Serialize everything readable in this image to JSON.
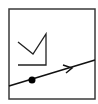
{
  "diagram": {
    "frame": {
      "x": 9,
      "y": 9,
      "width": 86,
      "height": 90,
      "stroke": "#3a3a3a"
    },
    "crown": {
      "points": "18,42 33,54 46,34 46,65 18,65",
      "stroke": "#222222"
    },
    "line": {
      "x1": 9,
      "y1": 86,
      "x2": 95,
      "y2": 60,
      "stroke": "#111111"
    },
    "dot": {
      "cx": 32,
      "cy": 80,
      "r": 3.5,
      "fill": "#000000"
    },
    "arrowhead": {
      "points": "63,65 72,68 66,73",
      "stroke": "#111111"
    }
  }
}
